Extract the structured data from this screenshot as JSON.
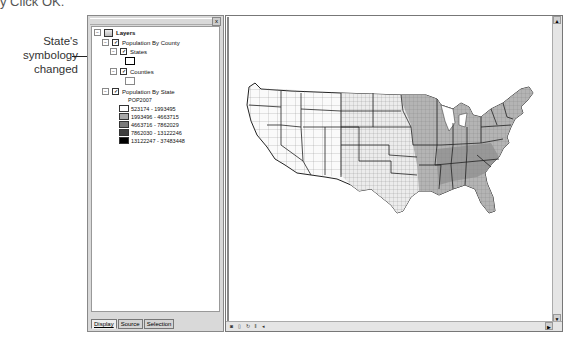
{
  "caption": {
    "step_text": "y Click OK.",
    "callout": "State's symbology changed"
  },
  "toc": {
    "root_label": "Layers",
    "groups": [
      {
        "label": "Population By County",
        "checked": true,
        "layers": [
          {
            "label": "States",
            "checked": true,
            "symbol": "hollow-thick-outline"
          },
          {
            "label": "Counties",
            "checked": true,
            "symbol": "hollow-outline"
          }
        ]
      },
      {
        "label": "Population By State",
        "checked": true,
        "field": "POP2007",
        "classes": [
          {
            "label": "523174 - 1993495",
            "color": "#ffffff"
          },
          {
            "label": "1993496 - 4663715",
            "color": "#a8a8a8"
          },
          {
            "label": "4663716 - 7862029",
            "color": "#7a7a7a"
          },
          {
            "label": "7862030 - 13122246",
            "color": "#3e3e3e"
          },
          {
            "label": "13122247 - 37483448",
            "color": "#000000"
          }
        ]
      }
    ],
    "tabs": [
      "Display",
      "Source",
      "Selection"
    ],
    "active_tab": "Display"
  },
  "map": {
    "toolbar_icons": [
      "data-view-icon",
      "layout-view-icon",
      "refresh-icon",
      "pause-icon",
      "scroll-left-icon"
    ],
    "scroll_up": "▲",
    "scroll_down": "▼",
    "scroll_right": "▶"
  }
}
